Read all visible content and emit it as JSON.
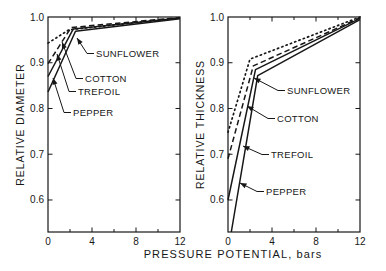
{
  "figure": {
    "xlabel": "PRESSURE POTENTIAL, bars",
    "background": "#ffffff",
    "ink_color": "#171717"
  },
  "chart_data": [
    {
      "type": "line",
      "panel": "left",
      "title": "",
      "ylabel": "RELATIVE DIAMETER",
      "xlabel": "PRESSURE POTENTIAL, bars",
      "xlim": [
        0,
        12
      ],
      "ylim": [
        0.53,
        1.0
      ],
      "xticks_major": [
        0,
        4,
        8,
        12
      ],
      "xticks_minor": [
        2,
        6,
        10
      ],
      "yticks": [
        1.0,
        0.9,
        0.8,
        0.7,
        0.6
      ],
      "grid": false,
      "legend_position": "in-plot-arrow-annotations",
      "series": [
        {
          "name": "SUNFLOWER",
          "style": "dotted",
          "points": [
            [
              0,
              0.943
            ],
            [
              1.9,
              0.972
            ],
            [
              12,
              0.998
            ]
          ]
        },
        {
          "name": "COTTON",
          "style": "dashed",
          "points": [
            [
              0,
              0.898
            ],
            [
              2.1,
              0.977
            ],
            [
              12,
              0.999
            ]
          ]
        },
        {
          "name": "TREFOIL",
          "style": "solid",
          "points": [
            [
              0,
              0.87
            ],
            [
              2.3,
              0.974
            ],
            [
              12,
              0.998
            ]
          ]
        },
        {
          "name": "PEPPER",
          "style": "solid",
          "points": [
            [
              0,
              0.836
            ],
            [
              2.5,
              0.969
            ],
            [
              12,
              0.996
            ]
          ]
        }
      ],
      "annotations": [
        {
          "label": "SUNFLOWER",
          "text_xy": [
            96,
            57
          ],
          "tip_xy": [
            77,
            38
          ]
        },
        {
          "label": "COTTON",
          "text_xy": [
            85,
            82
          ],
          "tip_xy": [
            62,
            42
          ]
        },
        {
          "label": "TREFOIL",
          "text_xy": [
            78,
            95
          ],
          "tip_xy": [
            57,
            54
          ]
        },
        {
          "label": "PEPPER",
          "text_xy": [
            73,
            116
          ],
          "tip_xy": [
            53,
            78
          ]
        }
      ]
    },
    {
      "type": "line",
      "panel": "right",
      "title": "",
      "ylabel": "RELATIVE THICKNESS",
      "xlabel": "PRESSURE POTENTIAL, bars",
      "xlim": [
        0,
        12
      ],
      "ylim": [
        0.53,
        1.0
      ],
      "xticks_major": [
        0,
        4,
        8,
        12
      ],
      "xticks_minor": [
        2,
        6,
        10
      ],
      "yticks": [
        1.0,
        0.9,
        0.8,
        0.7,
        0.6
      ],
      "grid": false,
      "legend_position": "in-plot-arrow-annotations",
      "series": [
        {
          "name": "SUNFLOWER",
          "style": "dotted",
          "points": [
            [
              0,
              0.748
            ],
            [
              2.0,
              0.908
            ],
            [
              12,
              1.0
            ]
          ]
        },
        {
          "name": "COTTON",
          "style": "dashed",
          "points": [
            [
              0,
              0.69
            ],
            [
              2.3,
              0.893
            ],
            [
              12,
              0.998
            ]
          ]
        },
        {
          "name": "TREFOIL",
          "style": "solid",
          "points": [
            [
              0,
              0.6
            ],
            [
              2.5,
              0.885
            ],
            [
              12,
              0.997
            ]
          ]
        },
        {
          "name": "PEPPER",
          "style": "solid",
          "points": [
            [
              0.3,
              0.53
            ],
            [
              2.7,
              0.872
            ],
            [
              12,
              0.994
            ]
          ]
        }
      ],
      "annotations": [
        {
          "label": "SUNFLOWER",
          "text_xy": [
            287,
            94
          ],
          "tip_xy": [
            254,
            78
          ]
        },
        {
          "label": "COTTON",
          "text_xy": [
            277,
            122
          ],
          "tip_xy": [
            247,
            106
          ]
        },
        {
          "label": "TREFOIL",
          "text_xy": [
            271,
            158
          ],
          "tip_xy": [
            243,
            146
          ]
        },
        {
          "label": "PEPPER",
          "text_xy": [
            266,
            195
          ],
          "tip_xy": [
            240,
            183
          ]
        }
      ]
    }
  ]
}
